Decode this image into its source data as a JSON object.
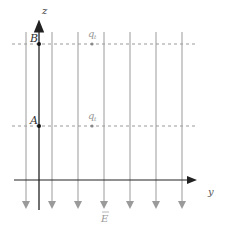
{
  "diagram": {
    "axes": {
      "z_label": "z",
      "y_label": "y"
    },
    "points": [
      {
        "name": "B",
        "label": "B"
      },
      {
        "name": "A",
        "label": "A"
      }
    ],
    "charges": [
      {
        "label": "q",
        "subscript": "t"
      },
      {
        "label": "q",
        "subscript": "t"
      }
    ],
    "field": {
      "label": "E",
      "direction": "down",
      "line_count": 7
    },
    "colors": {
      "axis": "#222222",
      "field_line": "#9a9a9a",
      "dashed": "#9a9a9a",
      "point": "#111111",
      "charge": "#888888"
    }
  }
}
